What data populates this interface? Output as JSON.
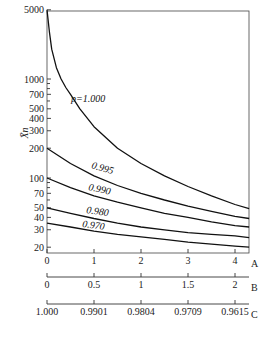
{
  "chart_data": {
    "type": "line",
    "title": "",
    "ylabel": "X̄n",
    "yscale": "log",
    "ylim": [
      15,
      5000
    ],
    "yticks": [
      5000,
      1000,
      700,
      500,
      400,
      300,
      200,
      100,
      70,
      50,
      40,
      30,
      20
    ],
    "xlim": [
      0,
      4.3
    ],
    "x_axes": [
      {
        "name": "A",
        "ticks": [
          "0",
          "1",
          "2",
          "3",
          "4"
        ]
      },
      {
        "name": "B",
        "ticks": [
          "0",
          "0.5",
          "1",
          "1.5",
          "2"
        ]
      },
      {
        "name": "C",
        "ticks": [
          "1.000",
          "0.9901",
          "0.9804",
          "0.9709",
          "0.9615"
        ]
      }
    ],
    "x": [
      0,
      0.5,
      1,
      1.5,
      2,
      2.5,
      3,
      3.5,
      4,
      4.3
    ],
    "series": [
      {
        "name": "p=1.000",
        "label": "p=1.000",
        "values": [
          5000,
          700,
          330,
          200,
          140,
          105,
          82,
          66,
          54,
          49
        ]
      },
      {
        "name": "0.995",
        "label": "0.995",
        "values": [
          200,
          140,
          105,
          84,
          70,
          60,
          52,
          46,
          41,
          39
        ]
      },
      {
        "name": "0.990",
        "label": "0.990",
        "values": [
          100,
          80,
          66,
          57,
          50,
          44,
          40,
          36,
          33,
          32
        ]
      },
      {
        "name": "0.980",
        "label": "0.980",
        "values": [
          50,
          44,
          39,
          35,
          32,
          30,
          28,
          27,
          26,
          25
        ]
      },
      {
        "name": "0.970",
        "label": "0.970",
        "values": [
          35,
          32,
          29,
          27,
          25.5,
          24,
          22.5,
          21.5,
          20.5,
          20
        ]
      }
    ],
    "grid": false,
    "legend": "inline curve labels"
  }
}
